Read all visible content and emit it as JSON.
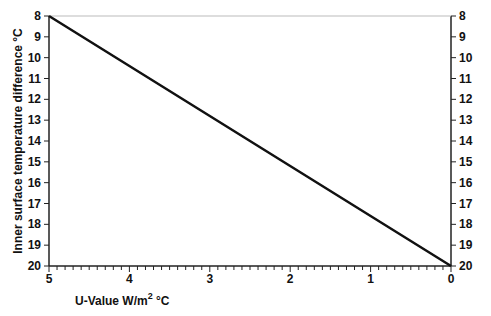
{
  "chart_data": {
    "type": "line",
    "title": "",
    "xlabel": "U-Value W/m² °C",
    "xlabel_parts": {
      "main": "U-Value W/m",
      "sup": "2",
      "tail": " °C"
    },
    "ylabel": "Inner surface temperature difference °C",
    "x_axis": {
      "range": [
        5,
        0
      ],
      "reversed": true,
      "major_ticks": [
        5,
        4,
        3,
        2,
        1,
        0
      ],
      "tick_labels": [
        "5",
        "4",
        "3",
        "2",
        "1",
        "0"
      ],
      "minor_tick_step": 0.1
    },
    "y_axis": {
      "range": [
        8,
        20
      ],
      "inverted": true,
      "ticks": [
        8,
        9,
        10,
        11,
        12,
        13,
        14,
        15,
        16,
        17,
        18,
        19,
        20
      ],
      "tick_labels": [
        "8",
        "9",
        "10",
        "11",
        "12",
        "13",
        "14",
        "15",
        "16",
        "17",
        "18",
        "19",
        "20"
      ],
      "mirrored_right": true
    },
    "grid": false,
    "legend": null,
    "series": [
      {
        "name": "Temperature difference vs U-Value",
        "x": [
          5,
          4,
          3,
          2,
          1,
          0
        ],
        "y": [
          8,
          10.4,
          12.8,
          15.2,
          17.6,
          20
        ]
      }
    ]
  }
}
